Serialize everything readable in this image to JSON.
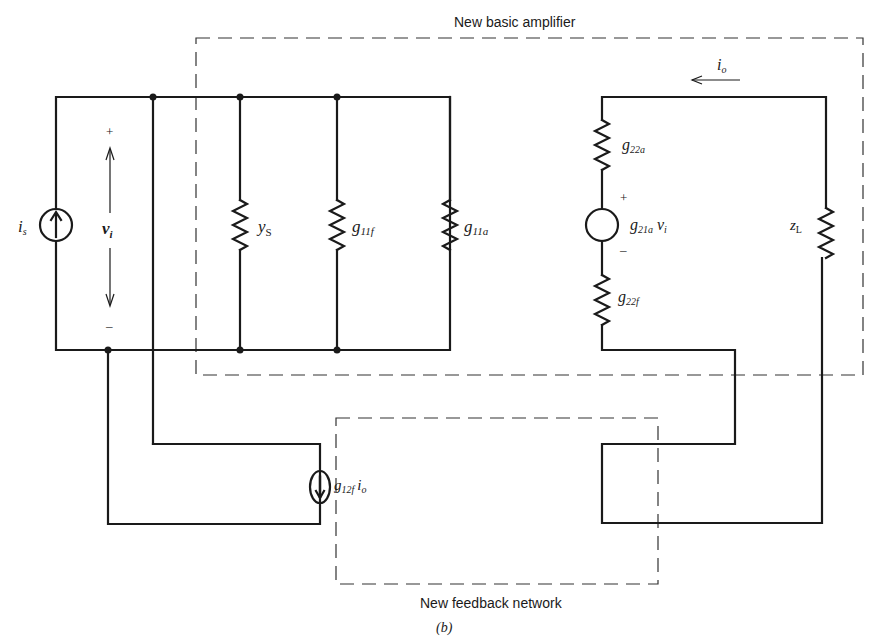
{
  "figure": {
    "caption": "(b)",
    "amplifier_box_label": "New basic amplifier",
    "feedback_box_label": "New feedback network"
  },
  "input_side": {
    "source": {
      "name": "i",
      "sub": "s"
    },
    "voltage": {
      "name": "v",
      "sub": "i",
      "plus": "+",
      "minus": "–"
    },
    "resistors": [
      {
        "name": "y",
        "sub": "S"
      },
      {
        "name": "g",
        "sub": "11f"
      },
      {
        "name": "g",
        "sub": "11a"
      }
    ]
  },
  "output_side": {
    "current": {
      "name": "i",
      "sub": "o"
    },
    "resistor_top": {
      "name": "g",
      "sub": "22a"
    },
    "dependent_source": {
      "name": "g",
      "sub": "21a",
      "suffix_name": "v",
      "suffix_sub": "i",
      "plus": "+",
      "minus": "–"
    },
    "resistor_bottom": {
      "name": "g",
      "sub": "22f"
    },
    "load": {
      "name": "z",
      "sub": "L"
    }
  },
  "feedback": {
    "source": {
      "name": "g",
      "sub": "12f",
      "suffix_name": "i",
      "suffix_sub": "o"
    }
  }
}
